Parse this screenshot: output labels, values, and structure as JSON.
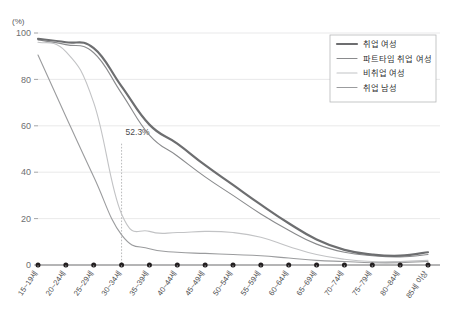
{
  "chart_data": {
    "type": "line",
    "title": "",
    "subtitle": "",
    "xlabel": "",
    "ylabel": "",
    "unit_label": "(%)",
    "ylim": [
      0,
      100
    ],
    "yticks": [
      0,
      20,
      40,
      60,
      80,
      100
    ],
    "grid": true,
    "legend_position": "top-right",
    "categories": [
      "15~19세",
      "20~24세",
      "25~29세",
      "30~34세",
      "35~39세",
      "40~44세",
      "45~49세",
      "50~54세",
      "55~59세",
      "60~64세",
      "65~69세",
      "70~74세",
      "75~79세",
      "80~84세",
      "85세 이상"
    ],
    "series": [
      {
        "name": "취업 여성",
        "color": "#6d6e70",
        "width": 2.2,
        "values": [
          97.5,
          96.0,
          93.5,
          77.0,
          60.5,
          52.3,
          43.0,
          34.5,
          26.0,
          18.0,
          11.0,
          6.5,
          4.5,
          4.0,
          5.5
        ]
      },
      {
        "name": "파트타임 취업 여성",
        "color": "#8a8b8d",
        "width": 1.1,
        "values": [
          97.0,
          95.0,
          91.5,
          74.0,
          56.0,
          47.0,
          38.0,
          30.0,
          22.0,
          15.0,
          9.0,
          5.5,
          4.0,
          3.5,
          4.5
        ]
      },
      {
        "name": "비취업 여성",
        "color": "#c2c3c5",
        "width": 1.1,
        "values": [
          96.0,
          92.0,
          70.0,
          22.0,
          14.5,
          14.0,
          14.5,
          14.0,
          12.0,
          8.0,
          4.5,
          2.5,
          1.5,
          1.5,
          2.0
        ]
      },
      {
        "name": "취업 남성",
        "color": "#9b9c9e",
        "width": 1.1,
        "values": [
          90.5,
          64.0,
          38.0,
          13.0,
          7.0,
          5.5,
          5.0,
          4.5,
          4.0,
          3.0,
          2.0,
          1.5,
          1.0,
          1.0,
          1.5
        ]
      }
    ],
    "annotations": [
      {
        "label": "52.3%",
        "category": "30~34세",
        "value": 52.3
      }
    ]
  },
  "legend": {
    "items": [
      {
        "label": "취업 여성"
      },
      {
        "label": "파트타임 취업 여성"
      },
      {
        "label": "비취업 여성"
      },
      {
        "label": "취업 남성"
      }
    ]
  }
}
